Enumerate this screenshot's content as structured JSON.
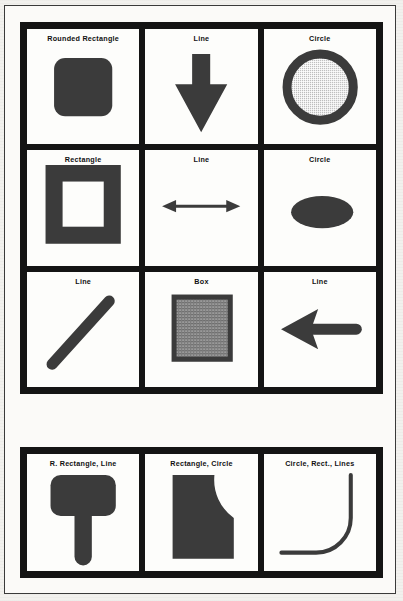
{
  "document": {
    "title": "Shape primitives reference sheet",
    "background_color": "#f2f1ee",
    "frame_color": "#3a3a3a",
    "grid_color": "#141414",
    "cell_color": "#fdfdfb",
    "ink_color": "#3b3b3b",
    "label_color": "#111111"
  },
  "grids": [
    {
      "name": "primitive-shapes-grid",
      "rows": 3,
      "columns": 3,
      "cells": [
        {
          "label": "Rounded Rectangle",
          "shape": "rounded-rectangle-filled"
        },
        {
          "label": "Line",
          "shape": "arrow-down-solid"
        },
        {
          "label": "Circle",
          "shape": "circle-ring-stippled"
        },
        {
          "label": "Rectangle",
          "shape": "rectangle-outline-thick"
        },
        {
          "label": "Line",
          "shape": "double-headed-arrow-horizontal"
        },
        {
          "label": "Circle",
          "shape": "ellipse-filled"
        },
        {
          "label": "Line",
          "shape": "diagonal-line-round-caps"
        },
        {
          "label": "Box",
          "shape": "box-hatched-fill"
        },
        {
          "label": "Line",
          "shape": "arrow-left-solid"
        }
      ]
    },
    {
      "name": "combined-shapes-grid",
      "rows": 1,
      "columns": 3,
      "cells": [
        {
          "label": "R. Rectangle, Line",
          "shape": "tee-rounded-rect-with-stem"
        },
        {
          "label": "Rectangle, Circle",
          "shape": "square-with-concave-corner"
        },
        {
          "label": "Circle, Rect., Lines",
          "shape": "elbow-curve-stroke"
        }
      ]
    }
  ]
}
